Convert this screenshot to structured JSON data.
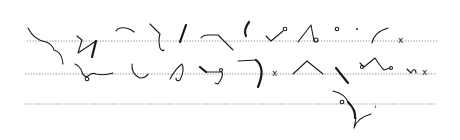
{
  "page": {
    "background": "#ffffff",
    "ink_color": "#1a1a1a",
    "rule_color": "#8a8a8a"
  },
  "rules": [
    {
      "y": 41,
      "x1": 27,
      "x2": 437
    },
    {
      "y": 74,
      "x1": 25,
      "x2": 437
    },
    {
      "y": 104,
      "x1": 25,
      "x2": 437
    }
  ],
  "marks": {
    "x1": "x",
    "x2": "x",
    "x3": "x",
    "x4": "x",
    "comma": ","
  }
}
